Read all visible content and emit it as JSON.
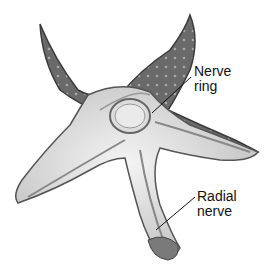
{
  "figure": {
    "labels": [
      {
        "text_line1": "Nerve",
        "text_line2": "ring"
      },
      {
        "text_line1": "Radial",
        "text_line2": "nerve"
      }
    ]
  },
  "colors": {
    "aboral_surface": "#6e6e6e",
    "oral_surface": "#e6e6e6",
    "outline": "#444444",
    "background": "#ffffff"
  }
}
